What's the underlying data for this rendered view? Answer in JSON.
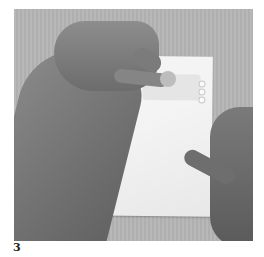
{
  "figure": {
    "label": "3",
    "colors": {
      "background": "#b4b4b4",
      "paper": "#f4f4f4",
      "skin": "#7d7d7d",
      "caption": "#222222"
    }
  }
}
